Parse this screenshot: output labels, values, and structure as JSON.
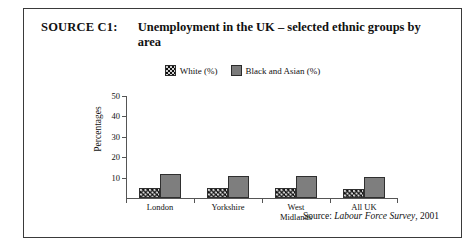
{
  "source_label": "SOURCE C1:",
  "title": "Unemployment in the UK – selected ethnic groups by area",
  "legend": [
    {
      "label": "White (%)",
      "swatch": "black-dotted-swatch-icon",
      "color": "#101010"
    },
    {
      "label": "Black and Asian (%)",
      "swatch": "gray-swatch-icon",
      "color": "#7b7b7b"
    }
  ],
  "source_note": {
    "prefix": "Source:",
    "publication": "Labour Force Survey",
    "suffix": ", 2001"
  },
  "chart_data": {
    "type": "bar",
    "title": "Unemployment in the UK – selected ethnic groups by area",
    "xlabel": "",
    "ylabel": "Percentages",
    "ylim": [
      0,
      50
    ],
    "yticks": [
      10,
      20,
      30,
      40,
      50
    ],
    "grid": false,
    "legend_position": "top-center",
    "categories": [
      "London",
      "Yorkshire",
      "West\nMidlands",
      "All UK"
    ],
    "series": [
      {
        "name": "White (%)",
        "color": "#101010",
        "values": [
          5,
          5,
          5,
          4.5
        ]
      },
      {
        "name": "Black and Asian (%)",
        "color": "#7e7e7e",
        "values": [
          12,
          11,
          11,
          10.5
        ]
      }
    ]
  }
}
